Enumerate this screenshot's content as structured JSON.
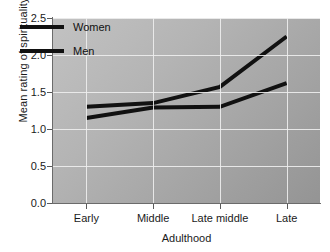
{
  "chart_data": {
    "type": "line",
    "title": "",
    "xlabel": "Adulthood",
    "ylabel": "Mean rating of spirituality",
    "categories": [
      "Early",
      "Middle",
      "Late middle",
      "Late"
    ],
    "series": [
      {
        "name": "Women",
        "values": [
          1.3,
          1.35,
          1.57,
          2.25
        ],
        "color": "#111111"
      },
      {
        "name": "Men",
        "values": [
          1.15,
          1.29,
          1.3,
          1.62
        ],
        "color": "#111111"
      }
    ],
    "ylim": [
      0.0,
      2.5
    ],
    "y_ticks": [
      "0.0",
      "0.5",
      "1.0",
      "1.5",
      "2.0",
      "2.5"
    ],
    "y_tick_values": [
      0.0,
      0.5,
      1.0,
      1.5,
      2.0,
      2.5
    ],
    "grid": true,
    "grid_color": "#eeeeee",
    "legend_position": "top-left-inside",
    "plot_background": "#b0b0b0",
    "line_width": 4
  },
  "axes": {
    "y_title": "Mean rating of spirituality",
    "x_title": "Adulthood"
  },
  "legend": {
    "entries": [
      {
        "label": "Women"
      },
      {
        "label": "Men"
      }
    ]
  }
}
